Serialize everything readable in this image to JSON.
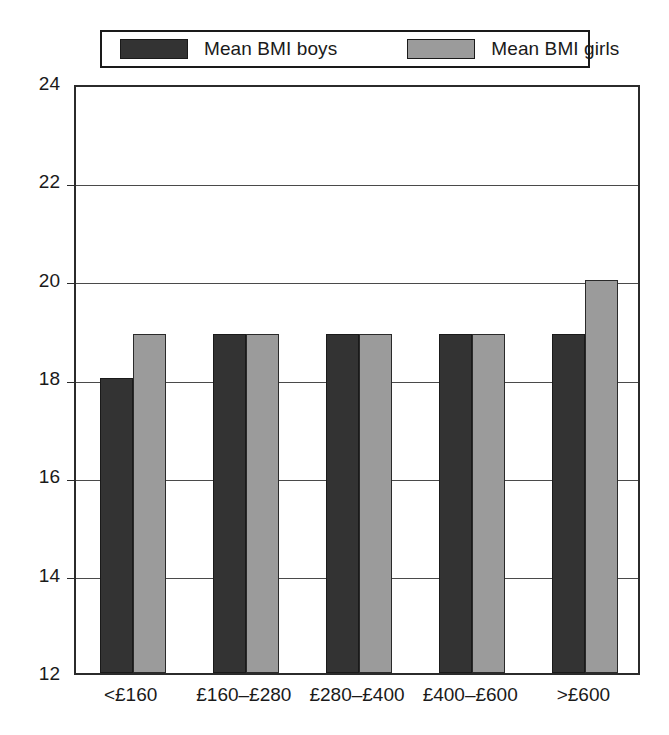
{
  "legend": {
    "entries": [
      {
        "label": "Mean BMI boys",
        "color": "#333333",
        "swatch_name": "legend-swatch-boys"
      },
      {
        "label": "Mean BMI girls",
        "color": "#9b9b9b",
        "swatch_name": "legend-swatch-girls"
      }
    ]
  },
  "chart_data": {
    "type": "bar",
    "title": "",
    "xlabel": "",
    "ylabel": "",
    "categories": [
      "<£160",
      "£160–£280",
      "£280–£400",
      "£400–£600",
      ">£600"
    ],
    "series": [
      {
        "name": "Mean BMI boys",
        "color": "#333333",
        "values": [
          18.0,
          18.9,
          18.9,
          18.9,
          18.9
        ]
      },
      {
        "name": "Mean BMI girls",
        "color": "#9b9b9b",
        "values": [
          18.9,
          18.9,
          18.9,
          18.9,
          20.0
        ]
      }
    ],
    "ylim": [
      12,
      24
    ],
    "yticks": [
      12,
      14,
      16,
      18,
      20,
      22,
      24
    ],
    "ytick_labels": [
      "12",
      "14",
      "16",
      "18",
      "20",
      "22",
      "24"
    ],
    "grid": true,
    "grid_axis": "y",
    "legend_position": "top"
  }
}
